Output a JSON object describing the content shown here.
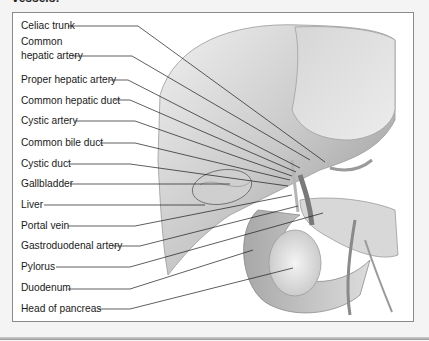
{
  "caption": "vessels:",
  "colors": {
    "frame_border": "#8a8a8a",
    "label_text": "#1a1a1a",
    "leader_line": "#1a1a1a",
    "organ_light": "#e6e6e6",
    "organ_dark": "#8c8c8c"
  },
  "labels": [
    {
      "id": "celiac-trunk",
      "text": "Celiac trunk",
      "y": 20
    },
    {
      "id": "common-hepatic-artery-1",
      "text": "Common",
      "y": 36
    },
    {
      "id": "common-hepatic-artery-2",
      "text": "hepatic artery",
      "y": 50
    },
    {
      "id": "proper-hepatic-artery",
      "text": "Proper hepatic artery",
      "y": 74
    },
    {
      "id": "common-hepatic-duct",
      "text": "Common hepatic duct",
      "y": 95
    },
    {
      "id": "cystic-artery",
      "text": "Cystic artery",
      "y": 115
    },
    {
      "id": "common-bile-duct",
      "text": "Common bile duct",
      "y": 137
    },
    {
      "id": "cystic-duct",
      "text": "Cystic duct",
      "y": 158
    },
    {
      "id": "gallbladder",
      "text": "Gallbladder",
      "y": 178
    },
    {
      "id": "liver",
      "text": "Liver",
      "y": 199
    },
    {
      "id": "portal-vein",
      "text": "Portal vein",
      "y": 220
    },
    {
      "id": "gastroduodenal-artery",
      "text": "Gastroduodenal artery",
      "y": 240
    },
    {
      "id": "pylorus",
      "text": "Pylorus",
      "y": 261
    },
    {
      "id": "duodenum",
      "text": "Duodenum",
      "y": 282
    },
    {
      "id": "head-of-pancreas",
      "text": "Head of pancreas",
      "y": 303
    }
  ]
}
